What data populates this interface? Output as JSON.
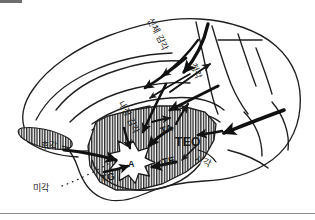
{
  "figure": {
    "type": "anatomical-diagram",
    "colors": {
      "ink": "#1a1a1a",
      "outline": "#222222",
      "hatch": "#2b2b2b",
      "background": "#ffffff",
      "rule": "#8c8c8c",
      "top_bar": "#6e6e6e"
    }
  },
  "sensory_labels": {
    "somatosensory": "신체 감각",
    "auditory": "청각",
    "visceral": "내장 감각",
    "visual": "시각",
    "olfactory": "후각",
    "gustatory": "미각"
  },
  "area_labels": {
    "ta": "TA",
    "te": "TE",
    "tg": "TG",
    "teo": "TEO",
    "amygdala": "A"
  },
  "structure": {
    "hatched_region_name": "temporal-lobe-hatched-region",
    "amygdala_shape": "star-burst",
    "arrow_count": 12
  }
}
